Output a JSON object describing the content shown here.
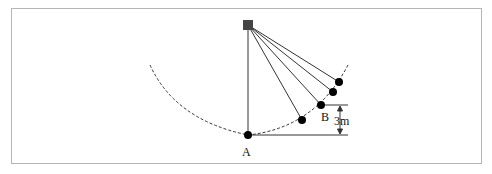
{
  "diagram": {
    "labels": {
      "point_a": "A",
      "point_b": "B",
      "height": "3m"
    },
    "pivot": {
      "x": 248,
      "y": 25,
      "size": 10,
      "color": "#444444"
    },
    "bobs": [
      {
        "name": "bob-a",
        "x": 248,
        "y": 135
      },
      {
        "name": "bob-1",
        "x": 302,
        "y": 120
      },
      {
        "name": "bob-b",
        "x": 321,
        "y": 105
      },
      {
        "name": "bob-3",
        "x": 333,
        "y": 92
      },
      {
        "name": "bob-4",
        "x": 339,
        "y": 82
      }
    ],
    "colors": {
      "line": "#333333",
      "bob": "#000000",
      "frame": "#b5b5b5"
    }
  }
}
